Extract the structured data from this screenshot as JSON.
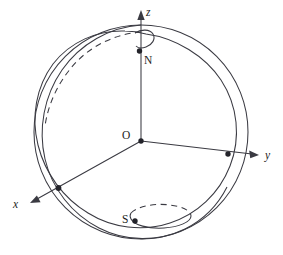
{
  "figure": {
    "kind": "sphere-coordinate-diagram",
    "background_color": "#ffffff",
    "ink_color": "#3a3a42",
    "labels": {
      "axis_z": "z",
      "axis_y": "y",
      "axis_x": "x",
      "origin": "O",
      "north_pole": "N",
      "south_pole": "S"
    },
    "elements": {
      "sphere_outline": "sphere-great-circle-outline",
      "tilted_great_circle_front": "tilted-great-circle-solid-front",
      "tilted_great_circle_back": "tilted-great-circle-dashed-back",
      "north_small_circle": "north-pole-small-circle",
      "south_small_circle": "south-pole-small-circle",
      "axis_z_line": "z-axis",
      "axis_y_line": "y-axis",
      "axis_x_line": "x-axis"
    },
    "marked_points": [
      {
        "name": "origin-point",
        "label": "O"
      },
      {
        "name": "north-pole-point",
        "label": "N"
      },
      {
        "name": "south-pole-point",
        "label": "S"
      },
      {
        "name": "y-axis-intersection-point",
        "label": ""
      },
      {
        "name": "x-axis-intersection-point",
        "label": ""
      }
    ]
  }
}
